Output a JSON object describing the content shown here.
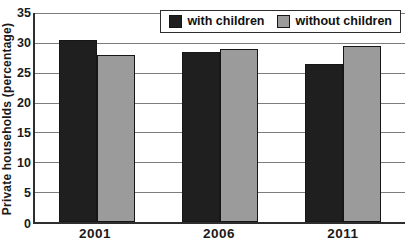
{
  "chart_data": {
    "type": "bar",
    "title": "",
    "ylabel": "Private households (percentage)",
    "xlabel": "",
    "ylim": [
      0,
      35
    ],
    "ytick_step": 5,
    "yticks": [
      0,
      5,
      10,
      15,
      20,
      25,
      30,
      35
    ],
    "grid": "horizontal",
    "legend_position": "top-right-inside",
    "categories": [
      "2001",
      "2006",
      "2011"
    ],
    "series": [
      {
        "name": "with children",
        "color": "#1f1f1f",
        "values": [
          30.5,
          28.5,
          26.5
        ]
      },
      {
        "name": "without children",
        "color": "#9b9b9b",
        "values": [
          28,
          29,
          29.5
        ]
      }
    ]
  },
  "colors": {
    "background": "#ffffff",
    "axis": "#2e2e2e",
    "gridline": "#7d7d7d",
    "text": "#1a1a1a"
  }
}
